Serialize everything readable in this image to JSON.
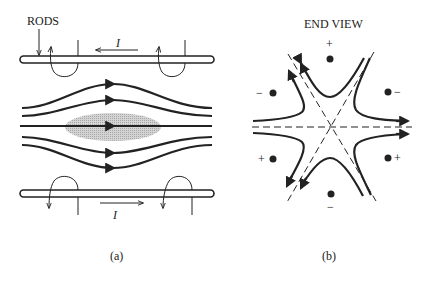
{
  "panel_a": {
    "rods_label": "RODS",
    "current_label_top": "I",
    "current_label_bottom": "I",
    "caption": "(a)"
  },
  "panel_b": {
    "title": "END VIEW",
    "charges": {
      "top": "+",
      "upper_left": "−",
      "upper_right": "−",
      "lower_left": "+",
      "lower_right": "+",
      "bottom": "−"
    },
    "caption": "(b)"
  },
  "colors": {
    "ink": "#222222",
    "beam_fill": "#c8c8c8"
  }
}
